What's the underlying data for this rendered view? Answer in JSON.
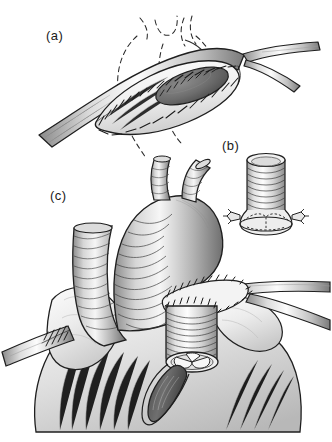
{
  "figure": {
    "background_color": "#ffffff",
    "width": 332,
    "height": 442,
    "style": "pen-and-ink medical line illustration with grayscale shading"
  },
  "panels": [
    {
      "id": "a",
      "label": "(a)",
      "label_x": 46,
      "label_y": 40,
      "caption": "Longitudinal aortotomy closed with an elliptical patch; dashed lines indicate the cardiac silhouette",
      "elements": [
        {
          "name": "great-vessel-trunk",
          "type": "tubular-vessel",
          "description": "Obliquely oriented vessel running from lower-left to upper-right"
        },
        {
          "name": "elliptical-patch",
          "type": "patch-graft",
          "description": "Lens-shaped patch sewn onto the vessel wall with continuous suture line"
        },
        {
          "name": "suture-line",
          "type": "running-suture",
          "stitch_count": 52,
          "description": "Continuous running stitches around the patch perimeter"
        },
        {
          "name": "aortotomy-lumen",
          "type": "dark-oval-opening",
          "fill": "#6d6d6d",
          "description": "Dark elliptical lumen opening within the patched region"
        },
        {
          "name": "vessel-bifurcation",
          "type": "branching-vessel",
          "description": "Vessel bifurcating toward the right edge"
        },
        {
          "name": "cardiac-silhouette-dashed",
          "type": "dashed-outline",
          "description": "Dashed curves outlining the heart and arch position"
        }
      ]
    },
    {
      "id": "b",
      "label": "(b)",
      "label_x": 222,
      "label_y": 150,
      "caption": "Valved conduit shown in isolation with corrugated wall and suture tabs",
      "elements": [
        {
          "name": "corrugated-conduit",
          "type": "ribbed-cylinder",
          "rib_count": 14,
          "description": "Cylindrical corrugated prosthetic tube graft viewed upright"
        },
        {
          "name": "conduit-rim",
          "type": "open-ellipse-rim",
          "description": "Open elliptical top rim of the conduit"
        },
        {
          "name": "valve-base",
          "type": "valve-cusp-outline",
          "description": "Dashed valve cusp commissures at the conduit base"
        },
        {
          "name": "suture-tab-left",
          "type": "anchoring-tab",
          "description": "Small anchoring suture tab on the left flange"
        },
        {
          "name": "suture-tab-right",
          "type": "anchoring-tab",
          "description": "Small anchoring suture tab on the right flange"
        }
      ]
    },
    {
      "id": "c",
      "label": "(c)",
      "label_x": 50,
      "label_y": 200,
      "caption": "Completed reconstruction: conduit anastomosed to the aortic arch with branch vessels reimplanted",
      "elements": [
        {
          "name": "ascending-aorta",
          "type": "corrugated-vessel",
          "description": "Large corrugated ascending aortic graft curving into the arch"
        },
        {
          "name": "arch-branch-left",
          "type": "branch-vessel",
          "description": "Left arch branch vessel ascending from the arch"
        },
        {
          "name": "arch-branch-right",
          "type": "branch-vessel",
          "description": "Right arch branch vessel ascending from the arch"
        },
        {
          "name": "superior-vena-cava",
          "type": "corrugated-vessel",
          "description": "Second large corrugated vessel to the left of the aorta"
        },
        {
          "name": "anastomosis-suture-ring",
          "type": "running-suture-ring",
          "stitch_count": 34,
          "description": "Circumferential suture ring joining conduit to the arch"
        },
        {
          "name": "implanted-conduit",
          "type": "ribbed-cylinder",
          "rib_count": 11,
          "description": "Corrugated conduit implanted into the ventricular outflow"
        },
        {
          "name": "conduit-valve",
          "type": "tricuspid-valve",
          "cusps": 3,
          "description": "Three-cusp valve visible within the conduit lumen"
        },
        {
          "name": "ventriculotomy-incision",
          "type": "tapered-incision",
          "description": "Tapered dark incision in the ventricular wall below the conduit"
        },
        {
          "name": "left-vessel-suture",
          "type": "running-suture",
          "stitch_count": 16,
          "description": "Suture line on the vessel entering from the left margin"
        },
        {
          "name": "right-vessel-bifurcation",
          "type": "branching-vessel",
          "description": "Bifurcating vessel toward the right margin"
        },
        {
          "name": "epicardial-fat",
          "type": "tissue-mass",
          "description": "Lobulated fatty tissue draped over the heart surface"
        },
        {
          "name": "ventricular-mass",
          "type": "tissue-mass",
          "description": "Large shaded ventricular mass forming the lower body of the heart"
        }
      ]
    }
  ],
  "palette": {
    "ink": "#1a1a1a",
    "line": "#2a2a2a",
    "dark_lumen": "#6d6d6d",
    "mid_gray": "#9a9a9a",
    "light_gray": "#cfcfcf",
    "pale_gray": "#e8e8e8",
    "highlight": "#f7f7f7",
    "background": "#ffffff"
  }
}
